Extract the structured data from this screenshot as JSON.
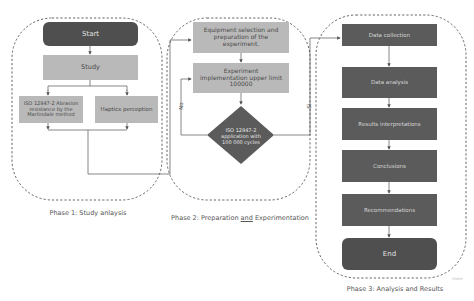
{
  "diagram": {
    "phases": [
      {
        "label": "Phase 1: Study anlaysis",
        "nodes": {
          "start": "Start",
          "study": "Study",
          "iso": "ISO 12947-2 Abrasion resistance by the Martindale method",
          "haptics": "Haptics perception"
        }
      },
      {
        "label_pre": "Phase 2: Preparation ",
        "label_under": "and",
        "label_post": " Experimentation",
        "nodes": {
          "equipment": "Equipment selection and preparation of the experiment.",
          "experiment": "Experiment implementation upper limit 100000",
          "decision": "ISO 12947-2 application with 100 000 cycles"
        },
        "edges": {
          "no_label": "No",
          "yes_label": "Si"
        }
      },
      {
        "label": "Phase 3: Analysis and Results",
        "nodes": {
          "data_collection": "Data collection",
          "data_analysis": "Data analysis",
          "results": "Results interpretations",
          "conclusions": "Conclusions",
          "recommendations": "Recommendations",
          "end": "End"
        }
      }
    ],
    "watermark": "more"
  },
  "colors": {
    "dark_node": "#5b5b5b",
    "terminal_node": "#4f4f4f",
    "light_node": "#b9b9b9",
    "connector": "#555555",
    "dashed_border": "#555555"
  }
}
